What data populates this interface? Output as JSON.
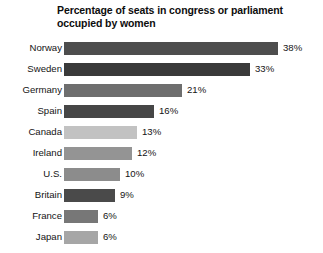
{
  "chart_data": {
    "type": "bar",
    "orientation": "horizontal",
    "title": "Percentage of seats in congress or parliament occupied by women",
    "title_line1": "Percentage of seats in congress or parliament",
    "title_line2": "occupied by women",
    "xlabel": "",
    "ylabel": "",
    "xlim": [
      0,
      38
    ],
    "grid": false,
    "legend": "none",
    "unit": "%",
    "categories": [
      "Norway",
      "Sweden",
      "Germany",
      "Spain",
      "Canada",
      "Ireland",
      "U.S.",
      "Britain",
      "France",
      "Japan"
    ],
    "values": [
      38,
      33,
      21,
      16,
      13,
      12,
      10,
      9,
      6,
      6
    ],
    "value_labels": [
      "38%",
      "33%",
      "21%",
      "16%",
      "13%",
      "12%",
      "10%",
      "9%",
      "6%",
      "6%"
    ],
    "bar_colors": [
      "#4d4d4d",
      "#3a3a3a",
      "#6e6e6e",
      "#464646",
      "#c2c2c2",
      "#949494",
      "#8c8c8c",
      "#4a4a4a",
      "#777777",
      "#a6a6a6"
    ],
    "bars": [
      {
        "category": "Norway",
        "value": 38,
        "label": "38%",
        "color": "#4d4d4d"
      },
      {
        "category": "Sweden",
        "value": 33,
        "label": "33%",
        "color": "#3a3a3a"
      },
      {
        "category": "Germany",
        "value": 21,
        "label": "21%",
        "color": "#6e6e6e"
      },
      {
        "category": "Spain",
        "value": 16,
        "label": "16%",
        "color": "#464646"
      },
      {
        "category": "Canada",
        "value": 13,
        "label": "13%",
        "color": "#c2c2c2"
      },
      {
        "category": "Ireland",
        "value": 12,
        "label": "12%",
        "color": "#949494"
      },
      {
        "category": "U.S.",
        "value": 10,
        "label": "10%",
        "color": "#8c8c8c"
      },
      {
        "category": "Britain",
        "value": 9,
        "label": "9%",
        "color": "#4a4a4a"
      },
      {
        "category": "France",
        "value": 6,
        "label": "6%",
        "color": "#777777"
      },
      {
        "category": "Japan",
        "value": 6,
        "label": "6%",
        "color": "#a6a6a6"
      }
    ],
    "background_color": "#ffffff",
    "text_color": "#141414"
  }
}
